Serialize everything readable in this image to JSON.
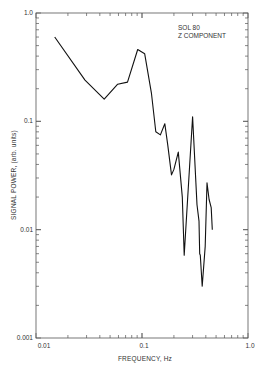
{
  "chart_data": {
    "type": "line",
    "title": "",
    "annotations": [
      "SOL 80",
      "Z COMPONENT"
    ],
    "xlabel": "FREQUENCY, Hz",
    "ylabel": "SIGNAL POWER, (arb. units)",
    "xscale": "log",
    "yscale": "log",
    "xlim": [
      0.01,
      1.0
    ],
    "ylim": [
      0.001,
      1.0
    ],
    "x_tick_labels": [
      "0.01",
      "0.1",
      "1.0"
    ],
    "y_tick_labels": [
      "0.001",
      "0.01",
      "0.1",
      "1.0"
    ],
    "grid": false,
    "legend": null,
    "series": [
      {
        "name": "Z component",
        "x": [
          0.015,
          0.029,
          0.044,
          0.059,
          0.073,
          0.091,
          0.106,
          0.123,
          0.135,
          0.149,
          0.164,
          0.175,
          0.19,
          0.2,
          0.22,
          0.24,
          0.25,
          0.3,
          0.33,
          0.345,
          0.35,
          0.355,
          0.37,
          0.395,
          0.41,
          0.43,
          0.45,
          0.46
        ],
        "y": [
          0.6,
          0.24,
          0.16,
          0.22,
          0.23,
          0.46,
          0.42,
          0.18,
          0.08,
          0.075,
          0.095,
          0.06,
          0.032,
          0.036,
          0.052,
          0.02,
          0.0058,
          0.11,
          0.017,
          0.012,
          0.006,
          0.0058,
          0.003,
          0.007,
          0.027,
          0.019,
          0.016,
          0.01
        ]
      }
    ]
  },
  "labels": {
    "y_1": "1.0",
    "y_01": "0.1",
    "y_001": "0.01",
    "y_0001": "0.001",
    "x_001": "0.01",
    "x_01": "0.1",
    "x_1": "1.0",
    "xlabel": "FREQUENCY, Hz",
    "ylabel": "SIGNAL POWER, (arb. units)",
    "annot1": "SOL 80",
    "annot2": "Z COMPONENT"
  }
}
